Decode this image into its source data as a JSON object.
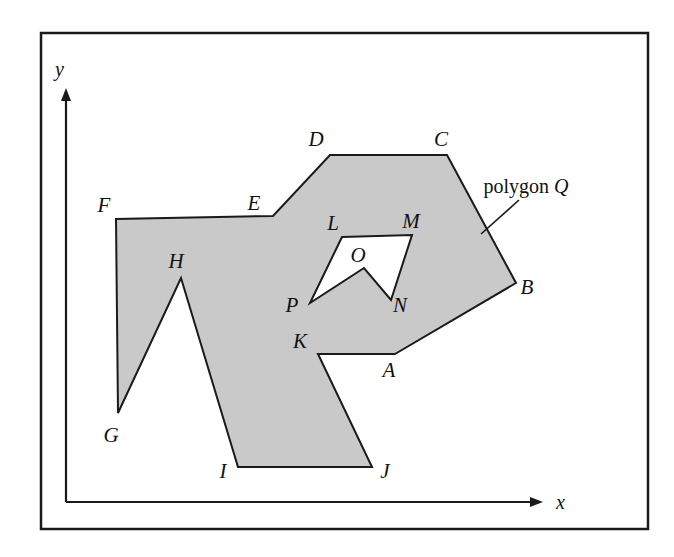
{
  "figure": {
    "frame": {
      "x": 41,
      "y": 33,
      "width": 607,
      "height": 496,
      "stroke": "#1a1a1a",
      "stroke_width": 2.5
    },
    "background_color": "#ffffff",
    "fill_color": "#c9c9c9",
    "outline_color": "#1a1a1a",
    "axes": {
      "origin": {
        "x": 66,
        "y": 502
      },
      "x_axis": {
        "x1": 66,
        "y1": 502,
        "x2": 543,
        "y2": 502,
        "label": "x",
        "label_x": 556,
        "label_y": 509
      },
      "y_axis": {
        "x1": 66,
        "y1": 502,
        "x2": 66,
        "y2": 88,
        "label": "y",
        "label_x": 55,
        "label_y": 76
      }
    },
    "callout": {
      "text_prefix": "polygon ",
      "text_symbol": "Q",
      "text_x": 526,
      "text_y": 193,
      "leader": {
        "x1": 519,
        "y1": 200,
        "x2": 481,
        "y2": 234
      }
    },
    "outer_boundary": {
      "name": "polygon-Q-outer",
      "points": [
        {
          "label": "A",
          "x": 395,
          "y": 354,
          "lx": 389,
          "ly": 377
        },
        {
          "label": "B",
          "x": 516,
          "y": 283,
          "lx": 527,
          "ly": 294
        },
        {
          "label": "C",
          "x": 447,
          "y": 155,
          "lx": 441,
          "ly": 146
        },
        {
          "label": "D",
          "x": 330,
          "y": 155,
          "lx": 316,
          "ly": 146
        },
        {
          "label": "E",
          "x": 273,
          "y": 216,
          "lx": 254,
          "ly": 210
        },
        {
          "label": "F",
          "x": 116,
          "y": 219,
          "lx": 104,
          "ly": 212
        },
        {
          "label": "G",
          "x": 118,
          "y": 413,
          "lx": 111,
          "ly": 442
        },
        {
          "label": "H",
          "x": 181,
          "y": 278,
          "lx": 176,
          "ly": 268
        },
        {
          "label": "I",
          "x": 238,
          "y": 467,
          "lx": 223,
          "ly": 478
        },
        {
          "label": "J",
          "x": 372,
          "y": 467,
          "lx": 385,
          "ly": 478
        },
        {
          "label": "K",
          "x": 318,
          "y": 354,
          "lx": 300,
          "ly": 348
        }
      ]
    },
    "hole_boundary": {
      "name": "polygon-Q-hole",
      "points": [
        {
          "label": "L",
          "x": 342,
          "y": 237,
          "lx": 333,
          "ly": 230
        },
        {
          "label": "M",
          "x": 412,
          "y": 235,
          "lx": 411,
          "ly": 228
        },
        {
          "label": "N",
          "x": 391,
          "y": 300,
          "lx": 400,
          "ly": 312
        },
        {
          "label": "O",
          "x": 364,
          "y": 268,
          "lx": 358,
          "ly": 262
        },
        {
          "label": "P",
          "x": 310,
          "y": 303,
          "lx": 292,
          "ly": 312
        }
      ]
    }
  }
}
